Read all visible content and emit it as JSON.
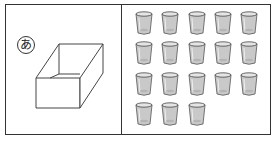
{
  "figure": {
    "left_panel": {
      "label": "あ",
      "object": "open-box"
    },
    "right_panel": {
      "object": "cup",
      "rows": [
        5,
        5,
        5,
        3
      ],
      "total": 18
    }
  }
}
